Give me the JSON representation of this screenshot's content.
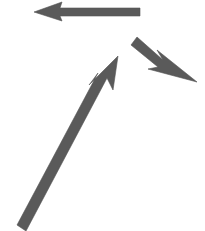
{
  "canvas": {
    "width": 205,
    "height": 231,
    "background_color": "#ffffff",
    "description": "Three gray arrows on a plain white background"
  },
  "style": {
    "arrow_fill": "#5a5a5a",
    "arrow_stroke": "#545454",
    "stroke_width": 0.6
  },
  "shapes": [
    {
      "name": "arrow-left-top",
      "label": "Horizontal arrow pointing left",
      "direction": "left",
      "tip": [
        34,
        12
      ],
      "tail": [
        140,
        12
      ],
      "shaft_width": 8,
      "color": "#5a5a5a",
      "points": "34,12 62,2 60,8 140,8 140,16 60,16 62,21"
    },
    {
      "name": "arrow-down-right-small",
      "label": "Small arrow pointing down-right",
      "direction": "down-right",
      "tip": [
        197,
        82
      ],
      "tail": [
        132,
        40
      ],
      "shaft_width": 9,
      "color": "#5a5a5a",
      "points": "197,82 157,50 163,60 137,37 131,45 158,67 148,69"
    },
    {
      "name": "arrow-up-right-large",
      "label": "Large diagonal arrow pointing up-right",
      "direction": "up-right",
      "tip": [
        118,
        56
      ],
      "tail": [
        21,
        228
      ],
      "shaft_width": 9,
      "color": "#5a5a5a",
      "points": "118,56 113,90 107,78 26,231 17,225 98,73 89,85"
    }
  ]
}
